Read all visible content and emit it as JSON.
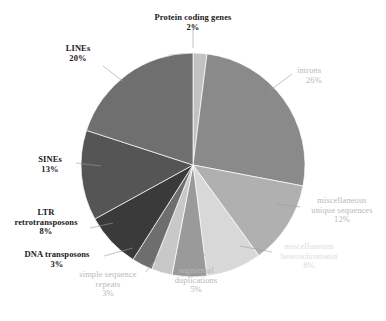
{
  "chart_data": {
    "type": "pie",
    "title": "",
    "subtitle": "",
    "xlabel": "",
    "ylabel": "",
    "legend_position": "none",
    "grid": false,
    "unit": "%",
    "total": 100,
    "categories": [
      "Protein coding genes",
      "introns",
      "miscellaneous unique sequences",
      "miscellaneous heterochromatin",
      "segmental duplications",
      "simple sequence repeats",
      "DNA transposons",
      "LTR retrotransposons",
      "SINEs",
      "LINEs"
    ],
    "values": [
      2,
      26,
      12,
      8,
      5,
      3,
      3,
      8,
      13,
      20
    ],
    "colors": [
      "#c2c2c2",
      "#8a8a8a",
      "#b0b0b0",
      "#d8d8d8",
      "#9a9a9a",
      "#c8c8c8",
      "#6e6e6e",
      "#3a3a3a",
      "#555555",
      "#6f6f6f"
    ],
    "slices": [
      {
        "label": "Protein coding genes",
        "value": 2,
        "pct_text": "2%",
        "color": "#c2c2c2"
      },
      {
        "label": "introns",
        "value": 26,
        "pct_text": "26%",
        "color": "#8a8a8a"
      },
      {
        "label": "miscellaneous unique sequences",
        "value": 12,
        "pct_text": "12%",
        "color": "#b0b0b0"
      },
      {
        "label": "miscellaneous heterochromatin",
        "value": 8,
        "pct_text": "8%",
        "color": "#d8d8d8"
      },
      {
        "label": "segmental duplications",
        "value": 5,
        "pct_text": "5%",
        "color": "#9a9a9a"
      },
      {
        "label": "simple sequence repeats",
        "value": 3,
        "pct_text": "3%",
        "color": "#c8c8c8"
      },
      {
        "label": "DNA transposons",
        "value": 3,
        "pct_text": "3%",
        "color": "#6e6e6e"
      },
      {
        "label": "LTR retrotransposons",
        "value": 8,
        "pct_text": "8%",
        "color": "#3a3a3a"
      },
      {
        "label": "SINEs",
        "value": 13,
        "pct_text": "13%",
        "color": "#555555"
      },
      {
        "label": "LINEs",
        "value": 20,
        "pct_text": "20%",
        "color": "#6f6f6f"
      }
    ]
  },
  "labels": {
    "protein_coding": {
      "line1": "Protein coding genes",
      "pct": "2%"
    },
    "introns": {
      "line1": "introns",
      "pct": "26%"
    },
    "misc_unique": {
      "line1": "miscellaneous",
      "line2": "unique sequences",
      "pct": "12%"
    },
    "misc_hetero": {
      "line1": "miscellaneous",
      "line2": "heterochromatin",
      "pct": "8%"
    },
    "segmental": {
      "line1": "segmental",
      "line2": "duplications",
      "pct": "5%"
    },
    "simple_repeats": {
      "line1": "simple sequence",
      "line2": "repeats",
      "pct": "3%"
    },
    "dna_transposons": {
      "line1": "DNA transposons",
      "pct": "3%"
    },
    "ltr": {
      "line1": "LTR",
      "line2": "retrotransposons",
      "pct": "8%"
    },
    "sines": {
      "line1": "SINEs",
      "pct": "13%"
    },
    "lines": {
      "line1": "LINEs",
      "pct": "20%"
    }
  }
}
